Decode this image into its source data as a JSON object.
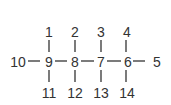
{
  "diagram": {
    "type": "molecular-skeleton-numbering",
    "main_chain": [
      {
        "id": "10",
        "x": 18,
        "y": 62
      },
      {
        "id": "9",
        "x": 49,
        "y": 62
      },
      {
        "id": "8",
        "x": 75,
        "y": 62
      },
      {
        "id": "7",
        "x": 101,
        "y": 62
      },
      {
        "id": "6",
        "x": 128,
        "y": 62
      },
      {
        "id": "5",
        "x": 157,
        "y": 62
      }
    ],
    "top_substituents": [
      {
        "id": "1",
        "x": 49,
        "y": 33,
        "attached_to": "9"
      },
      {
        "id": "2",
        "x": 75,
        "y": 33,
        "attached_to": "8"
      },
      {
        "id": "3",
        "x": 101,
        "y": 33,
        "attached_to": "7"
      },
      {
        "id": "4",
        "x": 128,
        "y": 33,
        "attached_to": "6"
      }
    ],
    "bottom_substituents": [
      {
        "id": "11",
        "x": 49,
        "y": 93,
        "attached_to": "9"
      },
      {
        "id": "12",
        "x": 75,
        "y": 93,
        "attached_to": "8"
      },
      {
        "id": "13",
        "x": 101,
        "y": 93,
        "attached_to": "7"
      },
      {
        "id": "14",
        "x": 128,
        "y": 93,
        "attached_to": "6"
      }
    ],
    "colors": {
      "ink": "#333333",
      "background": "#ffffff"
    }
  }
}
